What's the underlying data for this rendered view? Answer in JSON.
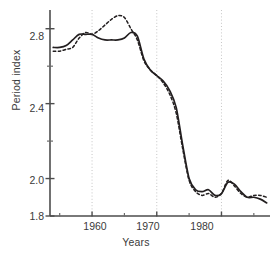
{
  "chart_data": {
    "type": "line",
    "title": "",
    "xlabel": "Years",
    "ylabel": "Period index",
    "xlim": [
      1953.5,
      1987.5
    ],
    "ylim": [
      1.8,
      2.9
    ],
    "grid": "vertical-dotted-at-decades",
    "legend": "none",
    "x_major_ticks": [
      1960,
      1970,
      1980
    ],
    "x_major_tick_labels": [
      "1960",
      "1970",
      "1980"
    ],
    "x_minor_ticks": [
      1955,
      1965,
      1975,
      1985
    ],
    "y_major_ticks": [
      1.8,
      2.0,
      2.4,
      2.8
    ],
    "y_major_tick_labels": [
      "1.8",
      "2.0",
      "2.4",
      "2.8"
    ],
    "y_minor_ticks": [
      2.2,
      2.6
    ],
    "series": [
      {
        "name": "solid-curve",
        "style": "solid",
        "color": "#231f20",
        "x": [
          1954,
          1955,
          1956,
          1957,
          1958,
          1959,
          1960,
          1961,
          1962,
          1963,
          1964,
          1965,
          1966,
          1967,
          1968,
          1969,
          1970,
          1971,
          1972,
          1973,
          1974,
          1975,
          1976,
          1977,
          1978,
          1979,
          1980,
          1981,
          1982,
          1983,
          1984,
          1985,
          1986,
          1987
        ],
        "values": [
          2.7,
          2.7,
          2.71,
          2.74,
          2.77,
          2.77,
          2.77,
          2.75,
          2.74,
          2.74,
          2.74,
          2.75,
          2.78,
          2.76,
          2.64,
          2.58,
          2.55,
          2.52,
          2.47,
          2.38,
          2.18,
          2.0,
          1.94,
          1.93,
          1.94,
          1.91,
          1.92,
          1.98,
          1.97,
          1.93,
          1.9,
          1.9,
          1.89,
          1.87
        ]
      },
      {
        "name": "dashed-curve",
        "style": "dashed",
        "color": "#231f20",
        "x": [
          1954,
          1955,
          1956,
          1957,
          1958,
          1959,
          1960,
          1961,
          1962,
          1963,
          1964,
          1965,
          1966,
          1967,
          1968,
          1969,
          1970,
          1971,
          1972,
          1973,
          1974,
          1975,
          1976,
          1977,
          1978,
          1979,
          1980,
          1981,
          1982,
          1983,
          1984,
          1985,
          1986,
          1987
        ],
        "values": [
          2.68,
          2.68,
          2.69,
          2.7,
          2.75,
          2.78,
          2.77,
          2.79,
          2.82,
          2.85,
          2.87,
          2.86,
          2.8,
          2.74,
          2.63,
          2.58,
          2.55,
          2.51,
          2.45,
          2.35,
          2.16,
          1.99,
          1.93,
          1.91,
          1.92,
          1.9,
          1.92,
          1.99,
          1.96,
          1.92,
          1.9,
          1.91,
          1.91,
          1.9
        ]
      }
    ]
  },
  "axes": {
    "ylabel": "Period index",
    "xlabel": "Years",
    "ytick_labels": [
      "2.8",
      "2.4",
      "2.0",
      "1.8"
    ],
    "xtick_labels": [
      "1960",
      "1970",
      "1980"
    ]
  },
  "colors": {
    "ink": "#231f20",
    "axis": "#4d4d4d",
    "grid": "#bfbfbf",
    "background": "#ffffff"
  }
}
